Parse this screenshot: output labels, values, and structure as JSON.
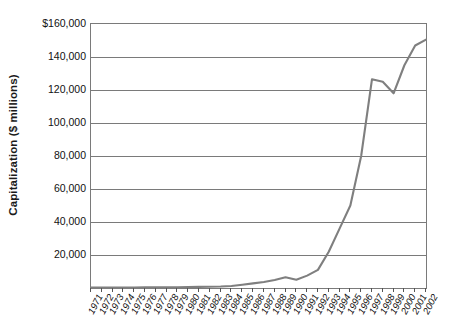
{
  "chart_data": {
    "type": "line",
    "title": "",
    "subtitle": "",
    "xlabel": "",
    "ylabel": "Capitalization ($ millions)",
    "ylim": [
      0,
      160000
    ],
    "xlim_categories": [
      "1971",
      "2002"
    ],
    "grid": "horizontal",
    "legend": "none",
    "line_color": "#7f7f7f",
    "axis_color": "#7a7a7a",
    "y_ticks": [
      {
        "value": 160000,
        "label": "$160,000"
      },
      {
        "value": 140000,
        "label": "140,000"
      },
      {
        "value": 120000,
        "label": "120,000"
      },
      {
        "value": 100000,
        "label": "100,000"
      },
      {
        "value": 80000,
        "label": "80,000"
      },
      {
        "value": 60000,
        "label": "60,000"
      },
      {
        "value": 40000,
        "label": "40,000"
      },
      {
        "value": 20000,
        "label": "20,000"
      }
    ],
    "categories": [
      "1971",
      "1972",
      "1973",
      "1974",
      "1975",
      "1976",
      "1977",
      "1978",
      "1979",
      "1980",
      "1981",
      "1982",
      "1983",
      "1984",
      "1985",
      "1986",
      "1987",
      "1988",
      "1989",
      "1990",
      "1991",
      "1992",
      "1993",
      "1994",
      "1995",
      "1996",
      "1997",
      "1998",
      "1999",
      "2000",
      "2001",
      "2002"
    ],
    "values": [
      200,
      250,
      280,
      300,
      330,
      360,
      400,
      450,
      500,
      600,
      700,
      800,
      900,
      1200,
      2000,
      2800,
      3600,
      4800,
      6500,
      5000,
      7500,
      11000,
      22000,
      36000,
      50000,
      80000,
      126500,
      125000,
      118000,
      135000,
      147000,
      150500
    ],
    "series": [
      {
        "name": "Capitalization",
        "values": [
          200,
          250,
          280,
          300,
          330,
          360,
          400,
          450,
          500,
          600,
          700,
          800,
          900,
          1200,
          2000,
          2800,
          3600,
          4800,
          6500,
          5000,
          7500,
          11000,
          22000,
          36000,
          50000,
          80000,
          126500,
          125000,
          118000,
          135000,
          147000,
          150500
        ]
      }
    ]
  }
}
